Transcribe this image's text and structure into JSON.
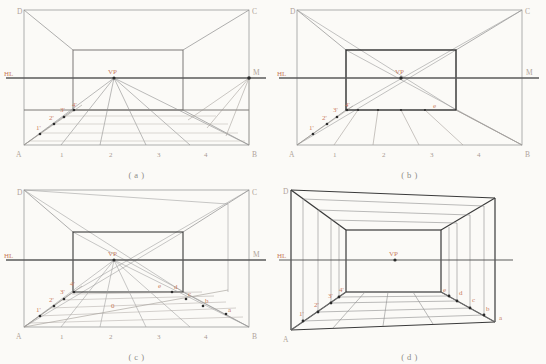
{
  "figure": {
    "background_color": "#fbfaf7",
    "line_color": "#8d8d8d",
    "heavy_line_color": "#3a3a3a",
    "label_color": "#a89b92",
    "accent_label_color": "#c97b5e"
  },
  "panels": [
    {
      "id": "a",
      "caption": "( a )",
      "corners": {
        "top_left": "D",
        "top_right": "C",
        "bottom_left": "A",
        "bottom_right": "B"
      },
      "horizon": {
        "left_label": "HL",
        "right_label": "M",
        "vanishing_point_label": "VP"
      },
      "baseline_divisions": [
        "1",
        "2",
        "3",
        "4"
      ],
      "measuring_points": [
        "1'",
        "2'",
        "3'",
        "4'"
      ],
      "floor_points": [],
      "description": "Room box with horizon line HL, vanishing point VP, measuring point M at right, baseline divisions 1-4 and diagonal measuring marks 1'-4'"
    },
    {
      "id": "b",
      "caption": "( b )",
      "corners": {
        "top_left": "D",
        "top_right": "C",
        "bottom_left": "A",
        "bottom_right": "B"
      },
      "horizon": {
        "left_label": "HL",
        "right_label": "M",
        "vanishing_point_label": "VP"
      },
      "baseline_divisions": [
        "1",
        "2",
        "3",
        "4"
      ],
      "measuring_points": [
        "1'",
        "2'",
        "3'",
        "4'"
      ],
      "floor_points": [
        "e"
      ],
      "description": "Back wall rectangle emphasised with full diagonals meeting at VP; floor lines converge from baseline divisions"
    },
    {
      "id": "c",
      "caption": "( c )",
      "corners": {
        "top_left": "D",
        "top_right": "C",
        "bottom_left": "A",
        "bottom_right": "B"
      },
      "horizon": {
        "left_label": "HL",
        "right_label": "M",
        "vanishing_point_label": "VP"
      },
      "baseline_divisions": [
        "1",
        "2",
        "3",
        "4"
      ],
      "measuring_points": [
        "1'",
        "2'",
        "3'",
        "4'"
      ],
      "floor_points": [
        "a",
        "b",
        "c",
        "d",
        "e"
      ],
      "origin_label": "0",
      "description": "Completed floor grid with transversal lines; right-hand diagonal marks a-e and centre point 0"
    },
    {
      "id": "d",
      "caption": "( d )",
      "corners": {
        "top_left": "D",
        "top_right": "C",
        "bottom_left": "A",
        "bottom_right": "B"
      },
      "horizon": {
        "left_label": "HL",
        "right_label": "",
        "vanishing_point_label": "VP"
      },
      "baseline_divisions": [],
      "measuring_points": [
        "1'",
        "2'",
        "3'",
        "4'"
      ],
      "floor_points": [
        "a",
        "b",
        "c",
        "d",
        "e"
      ],
      "description": "Finished interior box: walls, ceiling and floor grid rendered with vertical wall divisions rising from floor points"
    }
  ]
}
